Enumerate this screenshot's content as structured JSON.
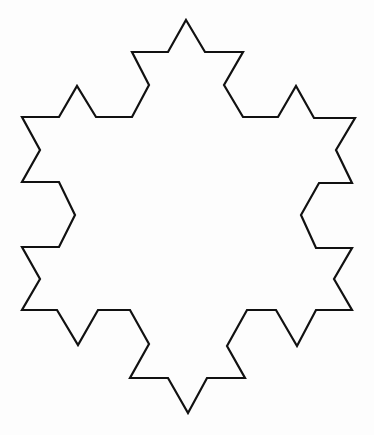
{
  "figure": {
    "title": "",
    "shape": "Koch snowflake (iteration 2)",
    "stroke_color": "#111111",
    "fill_color": "none",
    "points": [
      [
        186,
        20
      ],
      [
        205,
        52
      ],
      [
        243,
        52
      ],
      [
        224,
        85
      ],
      [
        243,
        117
      ],
      [
        278,
        117
      ],
      [
        296,
        86
      ],
      [
        314,
        118
      ],
      [
        355,
        118
      ],
      [
        336,
        150
      ],
      [
        352,
        183
      ],
      [
        319,
        183
      ],
      [
        301,
        215
      ],
      [
        316,
        248
      ],
      [
        352,
        248
      ],
      [
        334,
        279
      ],
      [
        352,
        310
      ],
      [
        316,
        310
      ],
      [
        297,
        346
      ],
      [
        276,
        310
      ],
      [
        247,
        310
      ],
      [
        227,
        346
      ],
      [
        245,
        378
      ],
      [
        207,
        378
      ],
      [
        188,
        413
      ],
      [
        168,
        378
      ],
      [
        130,
        378
      ],
      [
        149,
        344
      ],
      [
        130,
        310
      ],
      [
        98,
        310
      ],
      [
        78,
        345
      ],
      [
        57,
        310
      ],
      [
        22,
        310
      ],
      [
        40,
        279
      ],
      [
        22,
        247
      ],
      [
        59,
        247
      ],
      [
        75,
        215
      ],
      [
        59,
        182
      ],
      [
        22,
        182
      ],
      [
        40,
        150
      ],
      [
        22,
        117
      ],
      [
        59,
        117
      ],
      [
        77,
        86
      ],
      [
        96,
        117
      ],
      [
        132,
        117
      ],
      [
        149,
        85
      ],
      [
        132,
        52
      ],
      [
        168,
        52
      ]
    ]
  }
}
